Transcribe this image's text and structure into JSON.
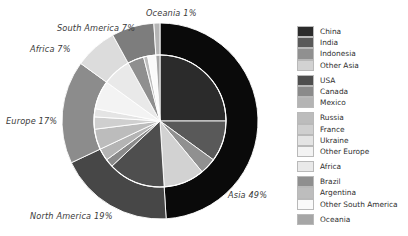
{
  "chart_data": {
    "type": "pie",
    "title": "",
    "subtitle": "",
    "xlabel": "",
    "ylabel": "",
    "legend_position": "right",
    "grid": false,
    "rings": [
      {
        "name": "outer",
        "role": "continents",
        "categories": [
          "Asia",
          "North America",
          "Europe",
          "Africa",
          "South America",
          "Oceania"
        ],
        "values": [
          49,
          19,
          17,
          7,
          7,
          1
        ],
        "colors": [
          "#0a0a0a",
          "#474747",
          "#8c8c8c",
          "#dcdcdc",
          "#7d7d7d",
          "#b5b5b5"
        ],
        "labels": [
          "Asia 49%",
          "North America 19%",
          "Europe 17%",
          "Africa 7%",
          "South America 7%",
          "Oceania 1%"
        ]
      },
      {
        "name": "inner",
        "role": "countries",
        "categories": [
          "China",
          "India",
          "Indonesia",
          "Other Asia",
          "USA",
          "Canada",
          "Mexico",
          "Russia",
          "France",
          "Ukraine",
          "Other Europe",
          "Africa",
          "Brazil",
          "Argentina",
          "Other South America",
          "Oceania"
        ],
        "values": [
          25,
          10,
          4,
          10,
          14,
          2,
          3,
          5,
          3,
          2,
          7,
          7,
          4,
          1,
          2,
          1
        ],
        "colors": [
          "#2b2b2b",
          "#595959",
          "#909090",
          "#d2d2d2",
          "#4e4e4e",
          "#8a8a8a",
          "#b4b4b4",
          "#bcbcbc",
          "#cfcfcf",
          "#e4e4e4",
          "#f3f3f3",
          "#e9e9e9",
          "#8f8f8f",
          "#bdbdbd",
          "#fafafa",
          "#a6a6a6"
        ]
      }
    ]
  },
  "callouts": {
    "oceania": "Oceania 1%",
    "south_america": "South America 7%",
    "africa": "Africa 7%",
    "europe": "Europe 17%",
    "north_america": "North America 19%",
    "asia": "Asia 49%"
  },
  "legend": {
    "groups": [
      {
        "group": "Asia",
        "items": [
          {
            "label": "China",
            "color": "#2b2b2b"
          },
          {
            "label": "India",
            "color": "#595959"
          },
          {
            "label": "Indonesia",
            "color": "#909090"
          },
          {
            "label": "Other Asia",
            "color": "#d2d2d2"
          }
        ]
      },
      {
        "group": "North America",
        "items": [
          {
            "label": "USA",
            "color": "#4e4e4e"
          },
          {
            "label": "Canada",
            "color": "#8a8a8a"
          },
          {
            "label": "Mexico",
            "color": "#b4b4b4"
          }
        ]
      },
      {
        "group": "Europe",
        "items": [
          {
            "label": "Russia",
            "color": "#bcbcbc"
          },
          {
            "label": "France",
            "color": "#cfcfcf"
          },
          {
            "label": "Ukraine",
            "color": "#e4e4e4"
          },
          {
            "label": "Other Europe",
            "color": "#f3f3f3"
          }
        ]
      },
      {
        "group": "Africa",
        "items": [
          {
            "label": "Africa",
            "color": "#e9e9e9"
          }
        ]
      },
      {
        "group": "South America",
        "items": [
          {
            "label": "Brazil",
            "color": "#8f8f8f"
          },
          {
            "label": "Argentina",
            "color": "#bdbdbd"
          },
          {
            "label": "Other South America",
            "color": "#fafafa"
          }
        ]
      },
      {
        "group": "Oceania",
        "items": [
          {
            "label": "Oceania",
            "color": "#a6a6a6"
          }
        ]
      }
    ]
  },
  "geometry": {
    "center_x": 160,
    "center_y": 121,
    "outer_radius": 98,
    "inner_ring_radius": 66,
    "start_angle_deg": -90
  }
}
